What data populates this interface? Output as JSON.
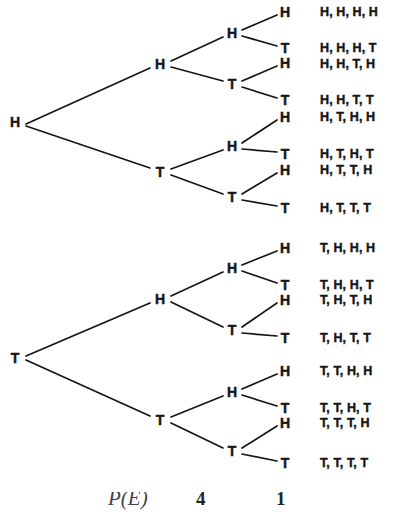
{
  "diagram": {
    "type": "binary-probability-tree",
    "depth": 4,
    "stroke_color": "#151515",
    "background_color": "#ffffff",
    "outcome_count": 16
  },
  "nodes": {
    "root": [
      {
        "label": "H",
        "x": 15,
        "y": 122
      },
      {
        "label": "T",
        "x": 15,
        "y": 358
      }
    ],
    "level2": [
      {
        "label": "H",
        "x": 160,
        "y": 64
      },
      {
        "label": "T",
        "x": 160,
        "y": 172
      },
      {
        "label": "H",
        "x": 160,
        "y": 299
      },
      {
        "label": "T",
        "x": 160,
        "y": 420
      }
    ],
    "level3": [
      {
        "label": "H",
        "x": 232,
        "y": 33
      },
      {
        "label": "T",
        "x": 232,
        "y": 84
      },
      {
        "label": "H",
        "x": 232,
        "y": 146
      },
      {
        "label": "T",
        "x": 232,
        "y": 197
      },
      {
        "label": "H",
        "x": 232,
        "y": 268
      },
      {
        "label": "T",
        "x": 232,
        "y": 330
      },
      {
        "label": "H",
        "x": 232,
        "y": 392
      },
      {
        "label": "T",
        "x": 232,
        "y": 451
      }
    ],
    "leaves": [
      {
        "label": "H",
        "x": 285,
        "y": 12
      },
      {
        "label": "T",
        "x": 285,
        "y": 48
      },
      {
        "label": "H",
        "x": 285,
        "y": 63
      },
      {
        "label": "T",
        "x": 285,
        "y": 100
      },
      {
        "label": "H",
        "x": 285,
        "y": 117
      },
      {
        "label": "T",
        "x": 285,
        "y": 154
      },
      {
        "label": "H",
        "x": 285,
        "y": 170
      },
      {
        "label": "T",
        "x": 285,
        "y": 208
      },
      {
        "label": "H",
        "x": 285,
        "y": 248
      },
      {
        "label": "T",
        "x": 285,
        "y": 285
      },
      {
        "label": "H",
        "x": 285,
        "y": 300
      },
      {
        "label": "T",
        "x": 285,
        "y": 338
      },
      {
        "label": "H",
        "x": 285,
        "y": 371
      },
      {
        "label": "T",
        "x": 285,
        "y": 408
      },
      {
        "label": "H",
        "x": 285,
        "y": 423
      },
      {
        "label": "T",
        "x": 285,
        "y": 463
      }
    ]
  },
  "outcomes": [
    {
      "text": "H, H, H, H",
      "y": 12
    },
    {
      "text": "H, H, H, T",
      "y": 48
    },
    {
      "text": "H, H, T, H",
      "y": 64
    },
    {
      "text": "H, H, T, T",
      "y": 100
    },
    {
      "text": "H, T, H, H",
      "y": 117
    },
    {
      "text": "H, T, H, T",
      "y": 154
    },
    {
      "text": "H, T, T, H",
      "y": 170
    },
    {
      "text": "H, T, T, T",
      "y": 208
    },
    {
      "text": "T, H, H, H",
      "y": 248
    },
    {
      "text": "T, H, H, T",
      "y": 285
    },
    {
      "text": "T, H, T, H",
      "y": 300
    },
    {
      "text": "T, H, T, T",
      "y": 338
    },
    {
      "text": "T, T, H, H",
      "y": 371
    },
    {
      "text": "T, T, H, T",
      "y": 408
    },
    {
      "text": "T, T, T, H",
      "y": 423
    },
    {
      "text": "T, T, T, T",
      "y": 463
    }
  ],
  "outcome_column_x": 320,
  "formula": {
    "expression": "P(E)",
    "numerator_left": "4",
    "numerator_right": "1",
    "note": "partially cut off at bottom edge"
  }
}
